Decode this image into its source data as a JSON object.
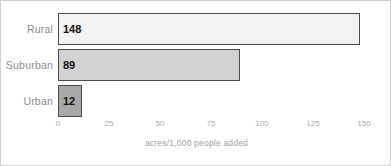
{
  "chart_data": {
    "type": "bar",
    "orientation": "horizontal",
    "title": "",
    "subtitle": "",
    "categories": [
      "Rural",
      "Suburban",
      "Urban"
    ],
    "values": [
      148,
      89,
      12
    ],
    "value_labels": [
      "148",
      "89",
      "12"
    ],
    "bar_colors": [
      "#f2f2f2",
      "#d2d2d2",
      "#a8a8a8"
    ],
    "bar_border_color": "#4a4a4a",
    "xlabel": "acres/1,000 people added",
    "ylabel": "",
    "xlim": [
      0,
      150
    ],
    "xticks": [
      0,
      25,
      50,
      75,
      100,
      125,
      150
    ],
    "xtick_labels": [
      "0",
      "25",
      "50",
      "75",
      "100",
      "125",
      "150"
    ],
    "grid": false,
    "legend": null,
    "annotations": []
  },
  "axis": {
    "title": "acres/1,000 people added",
    "tick_labels": [
      "0",
      "25",
      "50",
      "75",
      "100",
      "125",
      "150"
    ]
  },
  "rows": [
    {
      "label": "Rural",
      "value_label": "148"
    },
    {
      "label": "Suburban",
      "value_label": "89"
    },
    {
      "label": "Urban",
      "value_label": "12"
    }
  ],
  "colors": {
    "frame": "#cfcfcf",
    "bar_rural": "#f2f2f2",
    "bar_suburban": "#d2d2d2",
    "bar_urban": "#a8a8a8",
    "bar_outline": "#4a4a4a",
    "label_text": "#8c8c8c",
    "tick_text": "#a8a8a8",
    "value_text": "#111111"
  }
}
